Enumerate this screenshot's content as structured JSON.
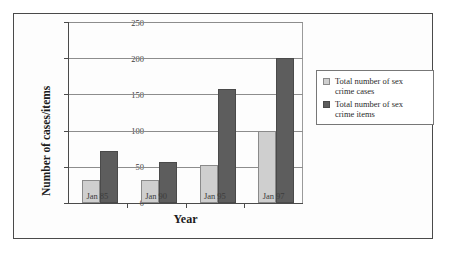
{
  "chart_data": {
    "type": "bar",
    "title": "",
    "xlabel": "Year",
    "ylabel": "Number of cases/items",
    "categories": [
      "Jan 85",
      "Jan 90",
      "Jan 95",
      "Jan 97"
    ],
    "series": [
      {
        "name": "Total number of sex crime cases",
        "color": "#cfcfcf",
        "values": [
          32,
          32,
          53,
          100
        ]
      },
      {
        "name": "Total number of sex crime items",
        "color": "#5d5d5d",
        "values": [
          72,
          57,
          158,
          200
        ]
      }
    ],
    "ylim": [
      0,
      250
    ],
    "yticks": [
      0,
      50,
      100,
      150,
      200,
      250
    ],
    "ytick_labels": [
      "0",
      "50",
      "100",
      "150",
      "200",
      "250"
    ],
    "grid": true,
    "legend_position": "right-outside"
  },
  "legend": {
    "entries": [
      {
        "label_line1": "Total number of sex",
        "label_line2": "crime cases",
        "swatch": "light-gray-square"
      },
      {
        "label_line1": "Total number of sex",
        "label_line2": "crime items",
        "swatch": "dark-gray-square"
      }
    ]
  }
}
